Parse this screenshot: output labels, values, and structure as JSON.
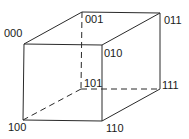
{
  "vertices": [
    {
      "id": "000",
      "label": "000"
    },
    {
      "id": "001",
      "label": "001"
    },
    {
      "id": "011",
      "label": "011"
    },
    {
      "id": "010",
      "label": "010"
    },
    {
      "id": "100",
      "label": "100"
    },
    {
      "id": "110",
      "label": "110"
    },
    {
      "id": "111",
      "label": "111"
    },
    {
      "id": "101",
      "label": "101"
    }
  ],
  "edges": [
    {
      "from": "000",
      "to": "001",
      "style": "solid"
    },
    {
      "from": "001",
      "to": "011",
      "style": "solid"
    },
    {
      "from": "011",
      "to": "010",
      "style": "solid"
    },
    {
      "from": "010",
      "to": "000",
      "style": "solid"
    },
    {
      "from": "000",
      "to": "100",
      "style": "solid"
    },
    {
      "from": "100",
      "to": "110",
      "style": "solid"
    },
    {
      "from": "110",
      "to": "010",
      "style": "solid"
    },
    {
      "from": "110",
      "to": "111",
      "style": "solid"
    },
    {
      "from": "111",
      "to": "011",
      "style": "solid"
    },
    {
      "from": "001",
      "to": "101",
      "style": "dashed"
    },
    {
      "from": "101",
      "to": "111",
      "style": "dashed"
    },
    {
      "from": "101",
      "to": "100",
      "style": "dashed"
    }
  ],
  "colors": {
    "line": "#2a2a2a",
    "text": "#1a1a1a",
    "background": "#ffffff"
  }
}
